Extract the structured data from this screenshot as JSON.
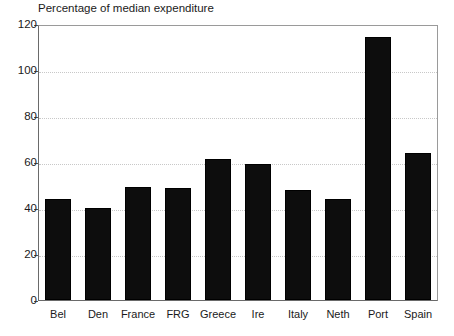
{
  "chart_data": {
    "type": "bar",
    "title": "Percentage of median expenditure",
    "xlabel": "",
    "ylabel": "",
    "ylim": [
      0,
      120
    ],
    "yticks": [
      0,
      20,
      40,
      60,
      80,
      100,
      120
    ],
    "grid": true,
    "legend": "none",
    "bar_color": "#0d0d0d",
    "categories": [
      "Bel",
      "Den",
      "France",
      "FRG",
      "Greece",
      "Ire",
      "Italy",
      "Neth",
      "Port",
      "Spain"
    ],
    "values": [
      44,
      40,
      49,
      48.5,
      61.5,
      59,
      48,
      44,
      114.5,
      64
    ]
  }
}
